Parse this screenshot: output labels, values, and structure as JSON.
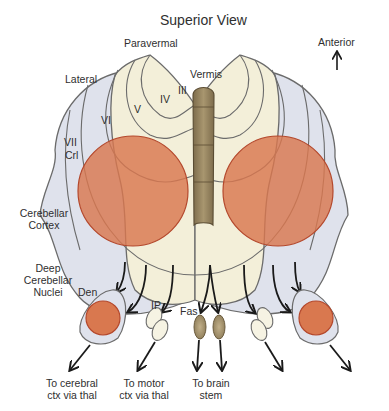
{
  "title": "Superior View",
  "orientation": {
    "label": "Anterior",
    "icon": "up-arrow-icon"
  },
  "cortex_labels": {
    "paravermal": "Paravermal",
    "lateral": "Lateral",
    "vermis": "Vermis",
    "lobules": [
      "III",
      "IV",
      "V",
      "VI"
    ],
    "lobule_vii": "VII",
    "crus": "Crl",
    "cerebellar_cortex_line1": "Cerebellar",
    "cerebellar_cortex_line2": "Cortex"
  },
  "nuclei_labels": {
    "group_line1": "Deep",
    "group_line2": "Cerebellar",
    "group_line3": "Nuclei",
    "dentate": "Den",
    "interposed": "IP",
    "fastigial": "Fas"
  },
  "outputs": [
    {
      "line1": "To cerebral",
      "line2": "ctx via thal"
    },
    {
      "line1": "To motor",
      "line2": "ctx via thal"
    },
    {
      "line1": "To brain",
      "line2": "stem"
    }
  ],
  "colors": {
    "lateral_zone": "#dfe2ec",
    "paravermal_zone": "#f3efd9",
    "vermis": "#8f7e5c",
    "highlight_circle": "#d9784f",
    "outline": "#6b6b6b",
    "arrow": "#1a1a1a"
  }
}
